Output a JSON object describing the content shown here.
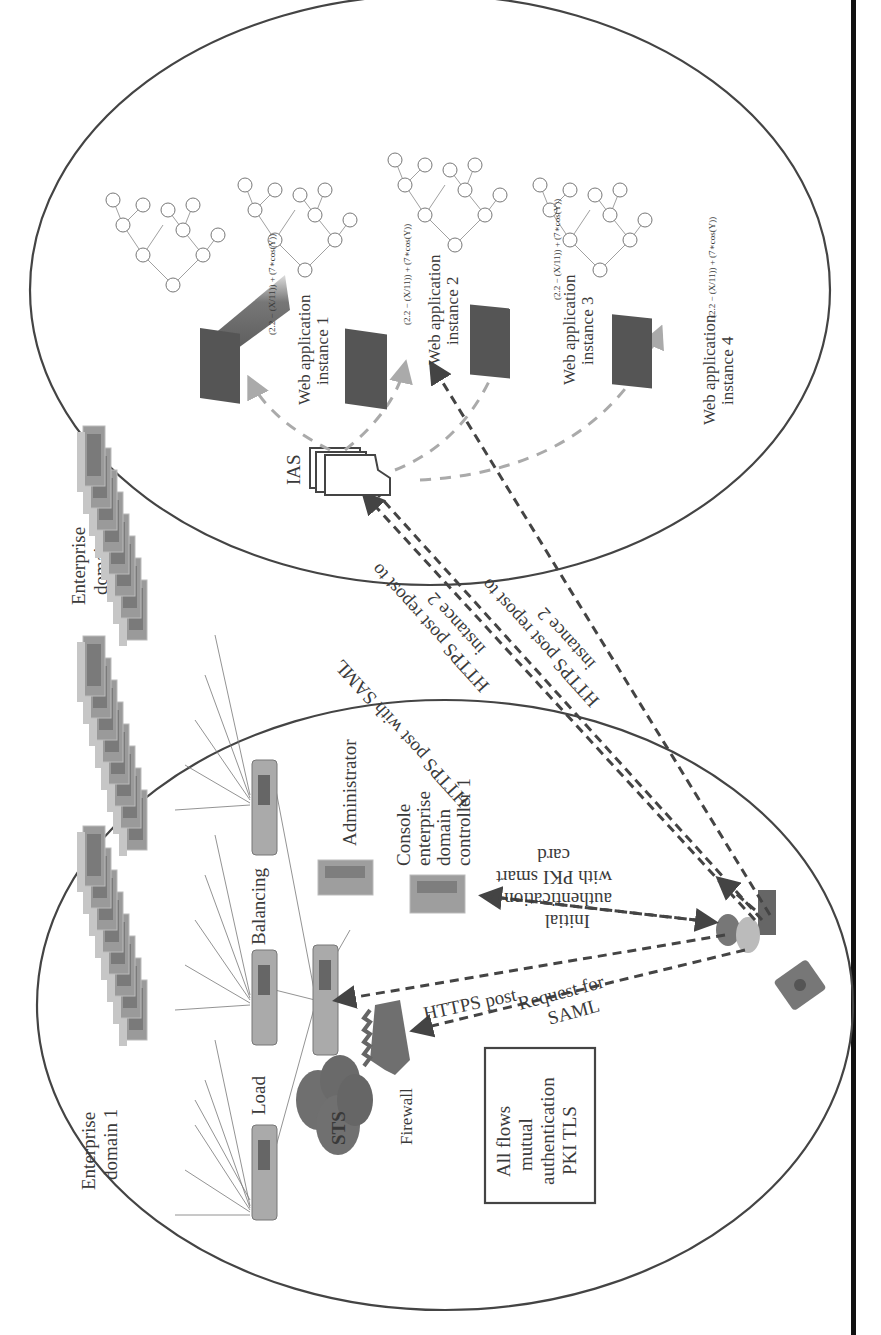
{
  "figure": {
    "orientation": "rotated 90 degrees counter-clockwise",
    "domains": [
      {
        "id": "enterprise-domain-1",
        "label_line1": "Enterprise",
        "label_line2": "domain 1"
      },
      {
        "id": "enterprise-domain-2",
        "label_line1": "Enterprise",
        "label_line2": "domain 2"
      }
    ],
    "domain1_components": {
      "load_label": "Load",
      "balancing_label": "Balancing",
      "sts_label": "STS",
      "firewall_label": "Firewall",
      "administrator_label": "Administrator",
      "console_label": [
        "Console",
        "enterprise",
        "domain",
        "controller 1"
      ],
      "note_box": [
        "All flows",
        "mutual",
        "authentication",
        "PKI TLS"
      ]
    },
    "domain2_components": {
      "ias_label": "IAS",
      "web_apps": [
        {
          "line1": "Web application",
          "line2": "instance 1"
        },
        {
          "line1": "Web application",
          "line2": "instance 2"
        },
        {
          "line1": "Web application",
          "line2": "instance 3"
        },
        {
          "line1": "Web application",
          "line2": "instance 4"
        }
      ],
      "formula": "(2.2 − (X/11)) + (7∗cos(Y))",
      "tree_nodes": [
        "+",
        "−",
        "∗",
        "2.2",
        "÷",
        "7",
        "cos",
        "X",
        "11",
        "Y"
      ]
    },
    "flows": {
      "https_post": "HTTPS post",
      "request_for_saml_1": "Request for",
      "request_for_saml_2": "SAML",
      "initial_auth_1": "Initial",
      "initial_auth_2": "authentication",
      "initial_auth_3": "with PKI smart",
      "initial_auth_4": "card",
      "https_post_saml": "HTTPS post with SAML",
      "repost_a_1": "HTTPS post repost to",
      "repost_a_2": "instance 2",
      "repost_b_1": "HTTPS post repost to",
      "repost_b_2": "instance 2"
    },
    "colors": {
      "outline": "#444444",
      "dark_dashed": "#444444",
      "light_dashed": "#aaaaaa",
      "server_gray": "#8a8a8a",
      "frame_bar": "#111111"
    }
  }
}
